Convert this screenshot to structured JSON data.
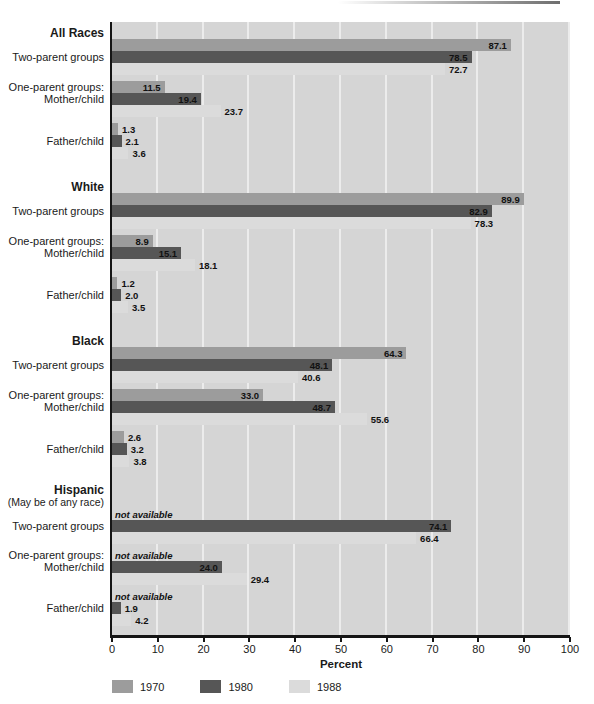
{
  "chart_data": {
    "type": "bar",
    "orientation": "horizontal",
    "xlabel": "Percent",
    "xlim": [
      0,
      100
    ],
    "xticks": [
      0,
      10,
      20,
      30,
      40,
      50,
      60,
      70,
      80,
      90,
      100
    ],
    "grid": "vertical white gridlines every 10 on gray panel",
    "legend_position": "bottom-left",
    "not_available_text": "not available",
    "legend": [
      {
        "label": "1970",
        "color": "#9c9c9c"
      },
      {
        "label": "1980",
        "color": "#565656"
      },
      {
        "label": "1988",
        "color": "#dbdbdb"
      }
    ],
    "sections": [
      {
        "name": "All Races",
        "subtitle": "",
        "groups": [
          {
            "row_labels": [
              "",
              "Two-parent groups",
              ""
            ],
            "values": [
              87.1,
              78.5,
              72.7
            ],
            "display": [
              "87.1",
              "78.5",
              "72.7"
            ]
          },
          {
            "row_labels": [
              "One-parent groups:",
              "Mother/child",
              ""
            ],
            "values": [
              11.5,
              19.4,
              23.7
            ],
            "display": [
              "11.5",
              "19.4",
              "23.7"
            ]
          },
          {
            "row_labels": [
              "",
              "Father/child",
              ""
            ],
            "values": [
              1.3,
              2.1,
              3.6
            ],
            "display": [
              "1.3",
              "2.1",
              "3.6"
            ]
          }
        ]
      },
      {
        "name": "White",
        "subtitle": "",
        "groups": [
          {
            "row_labels": [
              "",
              "Two-parent groups",
              ""
            ],
            "values": [
              89.9,
              82.9,
              78.3
            ],
            "display": [
              "89.9",
              "82.9",
              "78.3"
            ]
          },
          {
            "row_labels": [
              "One-parent groups:",
              "Mother/child",
              ""
            ],
            "values": [
              8.9,
              15.1,
              18.1
            ],
            "display": [
              "8.9",
              "15.1",
              "18.1"
            ]
          },
          {
            "row_labels": [
              "",
              "Father/child",
              ""
            ],
            "values": [
              1.2,
              2.0,
              3.5
            ],
            "display": [
              "1.2",
              "2.0",
              "3.5"
            ]
          }
        ]
      },
      {
        "name": "Black",
        "subtitle": "",
        "groups": [
          {
            "row_labels": [
              "",
              "Two-parent groups",
              ""
            ],
            "values": [
              64.3,
              48.1,
              40.6
            ],
            "display": [
              "64.3",
              "48.1",
              "40.6"
            ]
          },
          {
            "row_labels": [
              "One-parent groups:",
              "Mother/child",
              ""
            ],
            "values": [
              33.0,
              48.7,
              55.6
            ],
            "display": [
              "33.0",
              "48.7",
              "55.6"
            ]
          },
          {
            "row_labels": [
              "",
              "Father/child",
              ""
            ],
            "values": [
              2.6,
              3.2,
              3.8
            ],
            "display": [
              "2.6",
              "3.2",
              "3.8"
            ]
          }
        ]
      },
      {
        "name": "Hispanic",
        "subtitle": "(May be of any race)",
        "groups": [
          {
            "row_labels": [
              "",
              "Two-parent groups",
              ""
            ],
            "values": [
              null,
              74.1,
              66.4
            ],
            "display": [
              null,
              "74.1",
              "66.4"
            ]
          },
          {
            "row_labels": [
              "One-parent groups:",
              "Mother/child",
              ""
            ],
            "values": [
              null,
              24.0,
              29.4
            ],
            "display": [
              null,
              "24.0",
              "29.4"
            ]
          },
          {
            "row_labels": [
              "",
              "Father/child",
              ""
            ],
            "values": [
              null,
              1.9,
              4.2
            ],
            "display": [
              null,
              "1.9",
              "4.2"
            ]
          }
        ]
      }
    ],
    "colors": {
      "panel_background": "#d5d5d5",
      "gridline": "#ececec",
      "axis": "#151515",
      "bar_1970": "#9c9c9c",
      "bar_1980": "#565656",
      "bar_1988": "#dbdbdb"
    }
  }
}
